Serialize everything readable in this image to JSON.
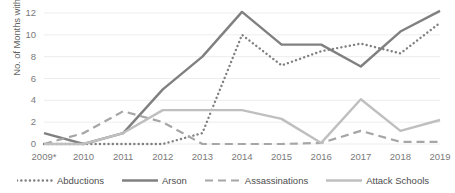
{
  "chart_data": {
    "type": "line",
    "title": "",
    "xlabel": "",
    "ylabel": "No. of Months with Attack",
    "categories": [
      "2009*",
      "2010",
      "2011",
      "2012",
      "2013",
      "2014",
      "2015",
      "2016",
      "2017",
      "2018",
      "2019"
    ],
    "ylim": [
      0,
      12
    ],
    "yticks": [
      0,
      2,
      4,
      6,
      8,
      10,
      12
    ],
    "grid": true,
    "legend_position": "bottom",
    "series": [
      {
        "name": "Abductions",
        "style": "dotted",
        "color": "#808080",
        "values": [
          0,
          0,
          0,
          0,
          1,
          10,
          7.2,
          8.5,
          9.2,
          8.3,
          11.1
        ]
      },
      {
        "name": "Arson",
        "style": "solid",
        "color": "#808080",
        "values": [
          1,
          0,
          1,
          5,
          8,
          12.1,
          9.1,
          9.1,
          7.1,
          10.3,
          12.2
        ]
      },
      {
        "name": "Assassinations",
        "style": "dashed",
        "color": "#a6a6a6",
        "values": [
          0,
          1,
          3,
          2,
          0,
          0,
          0,
          0.1,
          1.2,
          0.2,
          0.2
        ]
      },
      {
        "name": "Attack Schools",
        "style": "solid-light",
        "color": "#bfbfbf",
        "values": [
          0,
          0,
          1,
          3.1,
          3.1,
          3.1,
          2.3,
          0.1,
          4.1,
          1.2,
          2.2
        ]
      }
    ]
  },
  "axis": {
    "y_tick_labels": [
      "0",
      "2",
      "4",
      "6",
      "8",
      "10",
      "12"
    ],
    "y_title": "No. of Months with Attack"
  },
  "legend": {
    "items": [
      {
        "label": "Abductions",
        "icon": "dotted-line-icon"
      },
      {
        "label": "Arson",
        "icon": "solid-line-icon"
      },
      {
        "label": "Assassinations",
        "icon": "dashed-line-icon"
      },
      {
        "label": "Attack Schools",
        "icon": "solid-light-line-icon"
      }
    ]
  },
  "colors": {
    "grid": "#ededed",
    "axis_text": "#7a7a7a",
    "series_dark": "#808080",
    "series_mid": "#a6a6a6",
    "series_light": "#bfbfbf",
    "background": "#ffffff"
  }
}
